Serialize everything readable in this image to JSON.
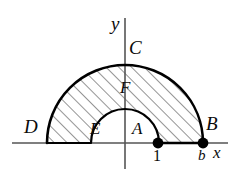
{
  "figure": {
    "axes": {
      "x_axis_label": "x",
      "y_axis_label": "y",
      "origin_x": 125,
      "origin_y": 143,
      "x_axis_start": 12,
      "x_axis_end": 228,
      "y_axis_top": 18,
      "y_axis_bottom": 169,
      "axis_color": "#555555"
    },
    "curves": {
      "outer_semicircle": {
        "name": "outer-semicircle",
        "radius": 78,
        "left_label": "D",
        "right_label": "B",
        "top_label": "C",
        "stroke": "#000000",
        "stroke_width": 2.4
      },
      "inner_semicircle": {
        "name": "inner-semicircle",
        "radius": 34,
        "left_label": "E",
        "right_label": "A",
        "top_label": "F",
        "stroke": "#000000",
        "stroke_width": 2.0
      }
    },
    "hatching": {
      "angle_deg": 45,
      "spacing": 9,
      "stroke": "#2b2b2b",
      "stroke_width": 1.0
    },
    "points": [
      {
        "name": "point-one",
        "label": "1",
        "x": 158,
        "radius": 5
      },
      {
        "name": "point-b",
        "label": "b",
        "x": 203,
        "radius": 5
      }
    ],
    "labels": {
      "y_axis": "y",
      "x_axis": "x",
      "outer_top": "C",
      "inner_top": "F",
      "outer_left": "D",
      "outer_right": "B",
      "inner_left": "E",
      "inner_right": "A",
      "tick_one": "1",
      "tick_b": "b"
    }
  }
}
